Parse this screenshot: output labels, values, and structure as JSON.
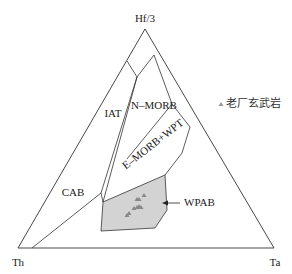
{
  "diagram": {
    "type": "ternary",
    "apices": {
      "top": "Hf/3",
      "left": "Th",
      "right": "Ta"
    },
    "fields": [
      {
        "id": "iat",
        "label": "IAT"
      },
      {
        "id": "n-morb",
        "label": "N–MORB"
      },
      {
        "id": "e-morb-wpt",
        "label": "E–MORB+WPT"
      },
      {
        "id": "cab",
        "label": "CAB"
      },
      {
        "id": "wpab",
        "label": "WPAB"
      }
    ],
    "legend": {
      "marker": "triangle",
      "label": "老厂玄武岩"
    },
    "colors": {
      "line": "#333333",
      "wpab_fill": "#d3d3d3",
      "marker": "#888888"
    },
    "sample_count": 9
  }
}
